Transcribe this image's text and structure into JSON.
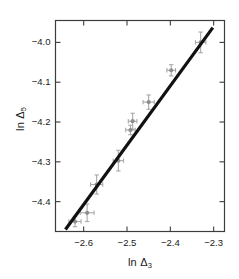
{
  "chart_data": {
    "type": "scatter",
    "title": "",
    "xlabel": "ln Δ3",
    "xlabel_base": "ln Δ",
    "xlabel_sub": "3",
    "ylabel": "ln Δ5",
    "ylabel_base": "ln Δ",
    "ylabel_sub": "5",
    "xlim": [
      -2.665,
      -2.275
    ],
    "ylim": [
      -4.475,
      -3.945
    ],
    "xticks": [
      -2.6,
      -2.5,
      -2.4,
      -2.3
    ],
    "xtick_labels": [
      "−2.6",
      "−2.5",
      "−2.4",
      "−2.3"
    ],
    "yticks": [
      -4.0,
      -4.1,
      -4.2,
      -4.3,
      -4.4
    ],
    "ytick_labels": [
      "−4.0",
      "−4.1",
      "−4.2",
      "−4.3",
      "−4.4"
    ],
    "grid": false,
    "legend": null,
    "frame": "box",
    "tick_direction": "in",
    "marker_color": "#a8a8a8",
    "errorbar_color": "#a8a8a8",
    "line_color": "#111111",
    "axis_color": "#3c3c3c",
    "text_color": "#1a1a1a",
    "series": [
      {
        "name": "data",
        "x": [
          -2.62,
          -2.592,
          -2.57,
          -2.52,
          -2.492,
          -2.487,
          -2.45,
          -2.398,
          -2.33
        ],
        "y": [
          -4.45,
          -4.428,
          -4.357,
          -4.297,
          -4.22,
          -4.198,
          -4.15,
          -4.07,
          -4.0
        ],
        "xerr": [
          0.014,
          0.016,
          0.014,
          0.012,
          0.011,
          0.01,
          0.013,
          0.01,
          0.012
        ],
        "yerr": [
          0.013,
          0.022,
          0.024,
          0.026,
          0.012,
          0.02,
          0.018,
          0.014,
          0.026
        ]
      }
    ],
    "fit_line": {
      "name": "linear fit",
      "x": [
        -2.642,
        -2.302
      ],
      "y": [
        -4.47,
        -3.963
      ],
      "slope": 1.49,
      "width_px": 3.2
    }
  }
}
